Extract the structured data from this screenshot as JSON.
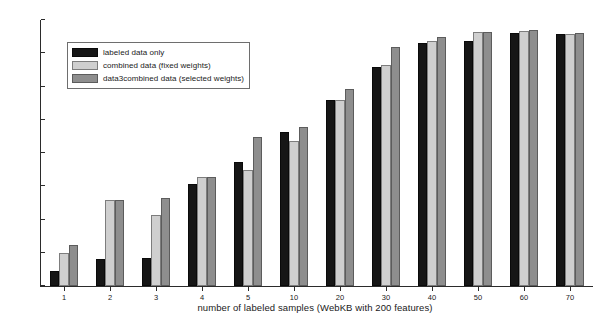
{
  "chart_data": {
    "type": "bar",
    "title": "",
    "xlabel": "number of labeled samples (WebKB with 200 features)",
    "ylabel": "micro-averaged F1 measure",
    "categories": [
      "1",
      "2",
      "3",
      "4",
      "5",
      "10",
      "20",
      "30",
      "40",
      "50",
      "60",
      "70"
    ],
    "ylim": [
      40,
      80
    ],
    "yticks": [
      40,
      45,
      50,
      55,
      60,
      65,
      70,
      75,
      80
    ],
    "grid": false,
    "legend_position": "upper-left",
    "series": [
      {
        "name": "labeled data only",
        "color": "#161616",
        "values": [
          42.3,
          44.0,
          44.2,
          55.4,
          58.7,
          63.2,
          68.0,
          73.0,
          76.6,
          76.8,
          78.0,
          77.9
        ]
      },
      {
        "name": "combined data (fixed weights)",
        "color": "#cfcfcf",
        "values": [
          45.0,
          53.0,
          50.7,
          56.4,
          57.5,
          61.8,
          68.0,
          73.3,
          76.8,
          78.2,
          78.3,
          77.9
        ]
      },
      {
        "name": "data3combined data (selected weights)",
        "color": "#8e8e8e",
        "values": [
          46.2,
          53.0,
          53.2,
          56.4,
          62.4,
          63.9,
          69.7,
          76.0,
          77.4,
          78.2,
          78.5,
          78.1
        ]
      }
    ]
  }
}
